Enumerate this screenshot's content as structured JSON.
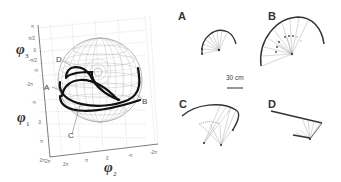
{
  "figure": {
    "sphere_plot": {
      "axes": {
        "phi3": {
          "symbol": "φ",
          "sub": "3"
        },
        "phi1": {
          "symbol": "φ",
          "sub": "1"
        },
        "phi2": {
          "symbol": "φ",
          "sub": "2"
        }
      },
      "vertical_ticks": [
        "π",
        "π/2",
        "0",
        "-π/2",
        "-π",
        "-2π",
        "-π",
        "0",
        "π",
        "2π"
      ],
      "bottom_ticks": [
        "2π",
        "2π",
        "π",
        "0",
        "-π",
        "-2π"
      ],
      "trajectory_labels": [
        "D",
        "A",
        "C",
        "B"
      ]
    },
    "panels": [
      {
        "label": "A"
      },
      {
        "label": "B"
      },
      {
        "label": "C"
      },
      {
        "label": "D"
      }
    ],
    "scale_bar": {
      "label": "30 cm"
    }
  }
}
